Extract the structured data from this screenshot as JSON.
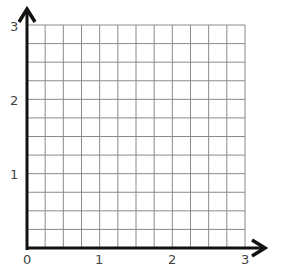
{
  "chart_data": {
    "type": "scatter",
    "title": "",
    "xlabel": "",
    "ylabel": "",
    "xlim": [
      0,
      3
    ],
    "ylim": [
      0,
      3
    ],
    "grid": true,
    "grid_subdivisions_per_unit": 4,
    "x_ticks": [
      "0",
      "1",
      "2",
      "3"
    ],
    "y_ticks": [
      "1",
      "2",
      "3"
    ],
    "series": [],
    "axis_arrows": true
  },
  "labels": {
    "origin": "0",
    "x1": "1",
    "x2": "2",
    "x3": "3",
    "y1": "1",
    "y2": "2",
    "y3": "3"
  },
  "colors": {
    "grid": "#8a8a8a",
    "axis": "#111111",
    "label": "#444444"
  }
}
